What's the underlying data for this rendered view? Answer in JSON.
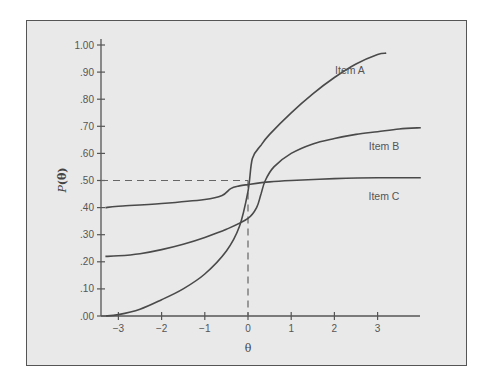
{
  "chart_data": {
    "type": "line",
    "title": "",
    "xlabel": "θ",
    "ylabel": "P(θ)",
    "xlim": [
      -3.3,
      4.0
    ],
    "ylim": [
      0.0,
      1.0
    ],
    "grid": false,
    "legend_position": "inline labels at right end of curves",
    "x_ticks": [
      "-3",
      "-2",
      "-1",
      "0",
      "1",
      "2",
      "3"
    ],
    "y_ticks": [
      ".00",
      ".10",
      ".20",
      ".30",
      ".40",
      ".50",
      ".60",
      ".70",
      ".80",
      ".90",
      "1.00"
    ],
    "reference_lines": [
      {
        "type": "horizontal-dashed",
        "y": 0.5,
        "x_from": -3.3,
        "x_to": 0
      },
      {
        "type": "vertical-dashed",
        "x": 0,
        "y_from": 0,
        "y_to": 0.5
      }
    ],
    "series": [
      {
        "name": "Item A",
        "x": [
          -3.3,
          -3.0,
          -2.5,
          -2.0,
          -1.5,
          -1.0,
          -0.5,
          -0.2,
          0.0,
          0.1,
          0.3,
          0.5,
          1.0,
          1.5,
          2.0,
          2.5,
          3.0,
          3.2
        ],
        "y": [
          0.0,
          0.005,
          0.025,
          0.06,
          0.1,
          0.155,
          0.24,
          0.33,
          0.46,
          0.58,
          0.63,
          0.67,
          0.75,
          0.82,
          0.88,
          0.93,
          0.965,
          0.97
        ]
      },
      {
        "name": "Item B",
        "x": [
          -3.3,
          -3.0,
          -2.5,
          -2.0,
          -1.5,
          -1.0,
          -0.5,
          0.0,
          0.2,
          0.3,
          0.4,
          0.6,
          1.0,
          1.5,
          2.0,
          2.5,
          3.0,
          3.5,
          4.0
        ],
        "y": [
          0.22,
          0.222,
          0.23,
          0.245,
          0.265,
          0.29,
          0.32,
          0.36,
          0.4,
          0.45,
          0.5,
          0.55,
          0.6,
          0.635,
          0.655,
          0.67,
          0.68,
          0.69,
          0.695
        ]
      },
      {
        "name": "Item C",
        "x": [
          -3.3,
          -3.0,
          -2.0,
          -1.0,
          -0.6,
          -0.4,
          -0.2,
          0.0,
          0.5,
          1.0,
          2.0,
          3.0,
          4.0
        ],
        "y": [
          0.4,
          0.405,
          0.415,
          0.43,
          0.445,
          0.47,
          0.48,
          0.485,
          0.495,
          0.5,
          0.507,
          0.51,
          0.51
        ]
      }
    ]
  }
}
